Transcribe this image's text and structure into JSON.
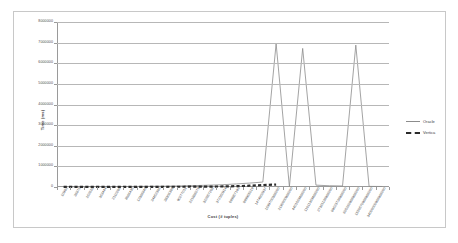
{
  "chart_data": {
    "type": "line",
    "title": "",
    "xlabel": "Cost (# tuples)",
    "ylabel": "Time (ms)",
    "ylim": [
      0,
      8000000
    ],
    "ytick_labels": [
      "8000000",
      "7000000",
      "6000000",
      "5000000",
      "4000000",
      "3000000",
      "2000000",
      "1000000",
      "0"
    ],
    "ytick_values": [
      8000000,
      7000000,
      6000000,
      5000000,
      4000000,
      3000000,
      2000000,
      1000000,
      0
    ],
    "grid": true,
    "legend_position": "right",
    "categories": [
      "10982",
      "36876",
      "262628",
      "363444",
      "2110286",
      "8086435",
      "12386846",
      "24452386",
      "38306389",
      "90277011",
      "221886079",
      "322657208",
      "372150914",
      "699857192",
      "899965019",
      "1474002937",
      "1699700386000",
      "2190000986000",
      "4401569486000",
      "11011369486000",
      "27361136986000",
      "89623736986000",
      "605260986986000",
      "1550570986986000",
      "34000000986986000"
    ],
    "series": [
      {
        "name": "Oracle",
        "style": "solid",
        "color": "#8c8c8c",
        "values": [
          12000,
          14000,
          16000,
          18000,
          22000,
          26000,
          30000,
          36000,
          42000,
          55000,
          70000,
          90000,
          110000,
          150000,
          190000,
          240000,
          6950000,
          20000,
          6720000,
          90000,
          60000,
          50000,
          6880000,
          30000,
          25000
        ]
      },
      {
        "name": "Vertica",
        "style": "dashed",
        "color": "#2b2b2b",
        "values": [
          6000,
          6500,
          7000,
          7500,
          8000,
          8500,
          9000,
          10000,
          11000,
          13000,
          16000,
          20000,
          26000,
          40000,
          62000,
          95000,
          120000,
          null,
          null,
          null,
          null,
          null,
          null,
          null,
          null
        ]
      }
    ],
    "legend": [
      {
        "label": "Oracle",
        "style": "solid"
      },
      {
        "label": "Vertica",
        "style": "dashed"
      }
    ]
  }
}
